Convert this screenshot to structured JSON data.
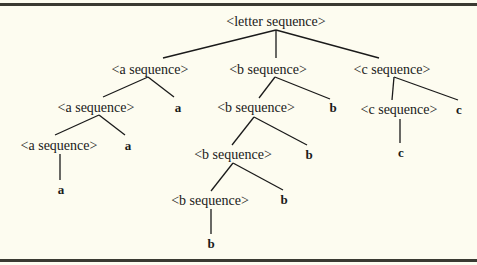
{
  "diagram": {
    "type": "parse-tree",
    "colors": {
      "background": "#fdfcf0",
      "ink": "#1a1a1a",
      "rule": "#3a3a32"
    },
    "nodes": {
      "root": {
        "label": "<letter sequence>",
        "x": 276,
        "y": 22
      },
      "a1": {
        "label": "<a sequence>",
        "x": 150,
        "y": 70
      },
      "b1": {
        "label": "<b sequence>",
        "x": 268,
        "y": 70
      },
      "c1": {
        "label": "<c sequence>",
        "x": 392,
        "y": 70
      },
      "a2": {
        "label": "<a sequence>",
        "x": 96,
        "y": 108
      },
      "a2_leaf": {
        "label": "a",
        "x": 178,
        "y": 108
      },
      "b2": {
        "label": "<b sequence>",
        "x": 256,
        "y": 108
      },
      "b2_leaf": {
        "label": "b",
        "x": 333,
        "y": 108
      },
      "c2": {
        "label": "<c sequence>",
        "x": 399,
        "y": 110
      },
      "c2_leaf": {
        "label": "c",
        "x": 459,
        "y": 110
      },
      "a3": {
        "label": "<a sequence>",
        "x": 59,
        "y": 146
      },
      "a3_leaf": {
        "label": "a",
        "x": 128,
        "y": 146
      },
      "b3": {
        "label": "<b sequence>",
        "x": 233,
        "y": 155
      },
      "b3_leaf": {
        "label": "b",
        "x": 309,
        "y": 155
      },
      "c3_leaf": {
        "label": "c",
        "x": 401,
        "y": 153
      },
      "a4_leaf": {
        "label": "a",
        "x": 61,
        "y": 190
      },
      "b4": {
        "label": "<b sequence>",
        "x": 210,
        "y": 201
      },
      "b4_leaf": {
        "label": "b",
        "x": 284,
        "y": 200
      },
      "b5_leaf": {
        "label": "b",
        "x": 211,
        "y": 244
      }
    },
    "edges": [
      {
        "from": "root",
        "to": "a1",
        "x1": 276,
        "y1": 30,
        "x2": 163,
        "y2": 58
      },
      {
        "from": "root",
        "to": "b1",
        "x1": 276,
        "y1": 30,
        "x2": 276,
        "y2": 58
      },
      {
        "from": "root",
        "to": "c1",
        "x1": 276,
        "y1": 30,
        "x2": 379,
        "y2": 58
      },
      {
        "from": "a1",
        "to": "a2",
        "x1": 148,
        "y1": 77,
        "x2": 103,
        "y2": 97
      },
      {
        "from": "a1",
        "to": "a2_leaf",
        "x1": 148,
        "y1": 77,
        "x2": 174,
        "y2": 97
      },
      {
        "from": "b1",
        "to": "b2",
        "x1": 275,
        "y1": 77,
        "x2": 259,
        "y2": 98
      },
      {
        "from": "b1",
        "to": "b2_leaf",
        "x1": 275,
        "y1": 77,
        "x2": 330,
        "y2": 99
      },
      {
        "from": "c1",
        "to": "c2",
        "x1": 394,
        "y1": 77,
        "x2": 392,
        "y2": 100
      },
      {
        "from": "c1",
        "to": "c2_leaf",
        "x1": 394,
        "y1": 77,
        "x2": 458,
        "y2": 100
      },
      {
        "from": "a2",
        "to": "a3",
        "x1": 99,
        "y1": 115,
        "x2": 55,
        "y2": 135
      },
      {
        "from": "a2",
        "to": "a3_leaf",
        "x1": 99,
        "y1": 115,
        "x2": 125,
        "y2": 135
      },
      {
        "from": "b2",
        "to": "b3",
        "x1": 254,
        "y1": 117,
        "x2": 232,
        "y2": 145
      },
      {
        "from": "b2",
        "to": "b3_leaf",
        "x1": 254,
        "y1": 117,
        "x2": 307,
        "y2": 145
      },
      {
        "from": "c2",
        "to": "c3_leaf",
        "x1": 400,
        "y1": 119,
        "x2": 400,
        "y2": 143
      },
      {
        "from": "a3",
        "to": "a4_leaf",
        "x1": 60,
        "y1": 154,
        "x2": 60,
        "y2": 180
      },
      {
        "from": "b3",
        "to": "b4",
        "x1": 233,
        "y1": 163,
        "x2": 211,
        "y2": 191
      },
      {
        "from": "b3",
        "to": "b4_leaf",
        "x1": 233,
        "y1": 163,
        "x2": 283,
        "y2": 190
      },
      {
        "from": "b4",
        "to": "b5_leaf",
        "x1": 211,
        "y1": 209,
        "x2": 211,
        "y2": 234
      }
    ]
  }
}
